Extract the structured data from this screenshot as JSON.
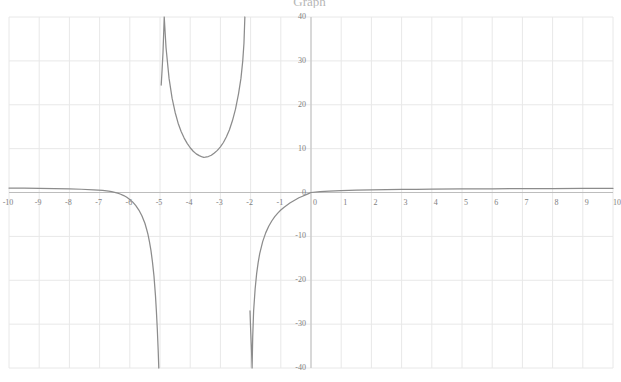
{
  "title": {
    "text": "Graph",
    "visible_partially": true
  },
  "chart_data": {
    "type": "line",
    "title": "Graph",
    "xlabel": "",
    "ylabel": "",
    "xlim": [
      -10,
      10
    ],
    "ylim": [
      -40,
      40
    ],
    "grid": true,
    "legend": null,
    "legend_position": "none",
    "x_ticks": [
      "-10",
      "-9",
      "-8",
      "-7",
      "-6",
      "-5",
      "-4",
      "-3",
      "-2",
      "-1",
      "0",
      "1",
      "2",
      "3",
      "4",
      "5",
      "6",
      "7",
      "8",
      "9",
      "10"
    ],
    "x_tick_values": [
      -10,
      -9,
      -8,
      -7,
      -6,
      -5,
      -4,
      -3,
      -2,
      -1,
      0,
      1,
      2,
      3,
      4,
      5,
      6,
      7,
      8,
      9,
      10
    ],
    "y_ticks": [
      "40",
      "30",
      "20",
      "10",
      "0",
      "-10",
      "-20",
      "-30",
      "-40"
    ],
    "y_tick_values": [
      40,
      30,
      20,
      10,
      0,
      -10,
      -20,
      -30,
      -40
    ],
    "curve_color": "#8c8c8c",
    "grid_color": "#e8e8e8",
    "axis_color": "#bdbdbd",
    "background_color": "#ffffff",
    "vertical_asymptotes": [
      -5.0,
      -2.0
    ],
    "horizontal_asymptote": 0,
    "local_minimum": {
      "x": -3.55,
      "y": 8.0
    },
    "series": [
      {
        "name": "branch-left",
        "description": "x from -10 to just left of -5: approaches y=+1 at far left, decreases through 0 near x=-6.6, plunges to -40 near x=-5.05",
        "points": [
          [
            -10.0,
            1.0
          ],
          [
            -9.5,
            0.97
          ],
          [
            -9.0,
            0.93
          ],
          [
            -8.5,
            0.88
          ],
          [
            -8.0,
            0.82
          ],
          [
            -7.6,
            0.74
          ],
          [
            -7.2,
            0.62
          ],
          [
            -6.9,
            0.48
          ],
          [
            -6.7,
            0.33
          ],
          [
            -6.6,
            0.2
          ],
          [
            -6.5,
            0.05
          ],
          [
            -6.4,
            -0.15
          ],
          [
            -6.3,
            -0.4
          ],
          [
            -6.2,
            -0.7
          ],
          [
            -6.1,
            -1.1
          ],
          [
            -6.0,
            -1.6
          ],
          [
            -5.9,
            -2.2
          ],
          [
            -5.8,
            -3.0
          ],
          [
            -5.7,
            -4.0
          ],
          [
            -5.6,
            -5.3
          ],
          [
            -5.5,
            -7.0
          ],
          [
            -5.45,
            -8.2
          ],
          [
            -5.4,
            -9.5
          ],
          [
            -5.35,
            -11.2
          ],
          [
            -5.3,
            -13.2
          ],
          [
            -5.25,
            -15.8
          ],
          [
            -5.2,
            -19.0
          ],
          [
            -5.15,
            -23.5
          ],
          [
            -5.12,
            -27.0
          ],
          [
            -5.09,
            -31.0
          ],
          [
            -5.06,
            -36.0
          ],
          [
            -5.04,
            -40.0
          ]
        ]
      },
      {
        "name": "branch-middle",
        "description": "x between -5 and -2: U-shaped branch rising to +40 at both asymptotes with minimum y≈8 near x=-3.55",
        "points": [
          [
            -4.86,
            40.0
          ],
          [
            -4.88,
            36.0
          ],
          [
            -4.9,
            32.0
          ],
          [
            -4.93,
            28.0
          ],
          [
            -4.96,
            24.5
          ],
          [
            -4.8,
            33.0
          ],
          [
            -4.7,
            26.0
          ],
          [
            -4.6,
            21.5
          ],
          [
            -4.5,
            18.3
          ],
          [
            -4.4,
            15.8
          ],
          [
            -4.3,
            13.9
          ],
          [
            -4.2,
            12.4
          ],
          [
            -4.1,
            11.2
          ],
          [
            -4.0,
            10.2
          ],
          [
            -3.9,
            9.4
          ],
          [
            -3.8,
            8.8
          ],
          [
            -3.7,
            8.4
          ],
          [
            -3.6,
            8.1
          ],
          [
            -3.55,
            8.0
          ],
          [
            -3.5,
            8.05
          ],
          [
            -3.4,
            8.2
          ],
          [
            -3.3,
            8.5
          ],
          [
            -3.2,
            9.0
          ],
          [
            -3.1,
            9.6
          ],
          [
            -3.0,
            10.4
          ],
          [
            -2.9,
            11.4
          ],
          [
            -2.8,
            12.7
          ],
          [
            -2.7,
            14.3
          ],
          [
            -2.6,
            16.4
          ],
          [
            -2.5,
            19.0
          ],
          [
            -2.4,
            22.5
          ],
          [
            -2.32,
            26.0
          ],
          [
            -2.26,
            30.0
          ],
          [
            -2.22,
            34.0
          ],
          [
            -2.19,
            40.0
          ]
        ]
      },
      {
        "name": "branch-right",
        "description": "x from just right of -2 to 10: rises steeply from -40 near x=-1.95, crosses 0 near x=-0.2, approaches y=+1 at far right",
        "points": [
          [
            -1.95,
            -40.0
          ],
          [
            -1.97,
            -36.0
          ],
          [
            -2.0,
            -31.0
          ],
          [
            -2.02,
            -27.0
          ],
          [
            -1.93,
            -33.0
          ],
          [
            -1.9,
            -27.0
          ],
          [
            -1.85,
            -22.0
          ],
          [
            -1.8,
            -18.5
          ],
          [
            -1.75,
            -16.0
          ],
          [
            -1.7,
            -14.0
          ],
          [
            -1.6,
            -11.2
          ],
          [
            -1.5,
            -9.2
          ],
          [
            -1.4,
            -7.7
          ],
          [
            -1.3,
            -6.5
          ],
          [
            -1.2,
            -5.5
          ],
          [
            -1.1,
            -4.7
          ],
          [
            -1.0,
            -4.0
          ],
          [
            -0.9,
            -3.4
          ],
          [
            -0.8,
            -2.9
          ],
          [
            -0.7,
            -2.4
          ],
          [
            -0.6,
            -2.0
          ],
          [
            -0.5,
            -1.6
          ],
          [
            -0.4,
            -1.2
          ],
          [
            -0.3,
            -0.9
          ],
          [
            -0.2,
            -0.6
          ],
          [
            -0.1,
            -0.3
          ],
          [
            0.0,
            0.0
          ],
          [
            0.3,
            0.18
          ],
          [
            0.6,
            0.3
          ],
          [
            1.0,
            0.42
          ],
          [
            1.5,
            0.52
          ],
          [
            2.0,
            0.59
          ],
          [
            2.5,
            0.65
          ],
          [
            3.0,
            0.69
          ],
          [
            3.5,
            0.73
          ],
          [
            4.0,
            0.76
          ],
          [
            5.0,
            0.81
          ],
          [
            6.0,
            0.85
          ],
          [
            7.0,
            0.88
          ],
          [
            8.0,
            0.91
          ],
          [
            9.0,
            0.93
          ],
          [
            10.0,
            0.95
          ]
        ]
      }
    ]
  }
}
